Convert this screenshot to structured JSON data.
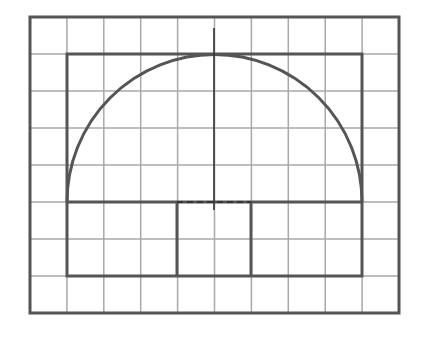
{
  "figure": {
    "grid": {
      "columns": 10,
      "rows": 8,
      "cell_size_px": 37,
      "line_color": "#a8a8a8"
    },
    "outline_color": "#555555",
    "outer_frame": {
      "x": 30,
      "y": 17,
      "width": 369,
      "height": 296
    },
    "shape": {
      "rectangle": {
        "x": 67,
        "y": 202,
        "width": 295,
        "height": 74
      },
      "semicircle": {
        "cx": 214.5,
        "cy": 202,
        "r": 147.5
      },
      "bounding_box": {
        "x": 67,
        "y": 54,
        "width": 295,
        "height": 222
      },
      "dividers_x": [
        177,
        251
      ]
    },
    "axis": {
      "vertical": {
        "x": 214,
        "y1": 28,
        "y2": 210
      },
      "horizontal_dashed": {
        "y": 202,
        "x1": 177,
        "x2": 251
      }
    }
  }
}
